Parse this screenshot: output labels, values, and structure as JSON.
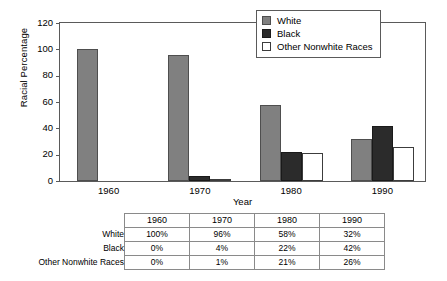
{
  "chart_data": {
    "type": "bar",
    "title": "",
    "xlabel": "Year",
    "ylabel": "Racial Percentage",
    "categories": [
      "1960",
      "1970",
      "1980",
      "1990"
    ],
    "series": [
      {
        "name": "White",
        "values": [
          100,
          96,
          58,
          32
        ],
        "color": "#808080"
      },
      {
        "name": "Black",
        "values": [
          0,
          4,
          22,
          42
        ],
        "color": "#2b2b2b"
      },
      {
        "name": "Other Nonwhite Races",
        "values": [
          0,
          1,
          21,
          26
        ],
        "color": "#ffffff"
      }
    ],
    "ylim": [
      0,
      120
    ],
    "yticks": [
      "0",
      "20",
      "40",
      "60",
      "80",
      "100",
      "120"
    ],
    "grid": false,
    "legend_position": "top-right"
  },
  "legend": {
    "items": [
      {
        "label": "White",
        "swatch": "white"
      },
      {
        "label": "Black",
        "swatch": "black"
      },
      {
        "label": "Other Nonwhite Races",
        "swatch": "other"
      }
    ]
  },
  "axes": {
    "y_label": "Racial Percentage",
    "x_label": "Year",
    "y_ticks": [
      "120",
      "100",
      "80",
      "60",
      "40",
      "20",
      "0"
    ],
    "x_ticks": [
      "1960",
      "1970",
      "1980",
      "1990"
    ]
  },
  "table": {
    "corner": "",
    "columns": [
      "1960",
      "1970",
      "1980",
      "1990"
    ],
    "rows": [
      {
        "label": "White",
        "cells": [
          "100%",
          "96%",
          "58%",
          "32%"
        ]
      },
      {
        "label": "Black",
        "cells": [
          "0%",
          "4%",
          "22%",
          "42%"
        ]
      },
      {
        "label": "Other Nonwhite Races",
        "cells": [
          "0%",
          "1%",
          "21%",
          "26%"
        ]
      }
    ]
  }
}
